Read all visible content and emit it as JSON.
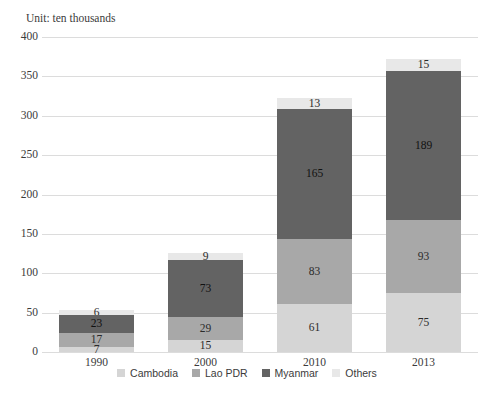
{
  "chart_data": {
    "type": "bar",
    "subtype": "stacked-bar",
    "title": "",
    "unit_note": "Unit: ten thousands",
    "xlabel": "",
    "ylabel": "",
    "categories": [
      "1990",
      "2000",
      "2010",
      "2013"
    ],
    "ylim": [
      0,
      400
    ],
    "yticks": [
      0,
      50,
      100,
      150,
      200,
      250,
      300,
      350,
      400
    ],
    "ytick_labels": [
      "0",
      "50",
      "100",
      "150",
      "200",
      "250",
      "300",
      "350",
      "400"
    ],
    "grid": true,
    "legend_position": "bottom",
    "stack_order_bottom_to_top": [
      "Cambodia",
      "Lao PDR",
      "Myanmar",
      "Others"
    ],
    "series": [
      {
        "name": "Cambodia",
        "color": "#d5d5d5",
        "values": [
          7,
          15,
          61,
          75
        ],
        "labels": [
          "7",
          "15",
          "61",
          "75"
        ]
      },
      {
        "name": "Lao PDR",
        "color": "#a8a8a8",
        "values": [
          17,
          29,
          83,
          93
        ],
        "labels": [
          "17",
          "29",
          "83",
          "93"
        ]
      },
      {
        "name": "Myanmar",
        "color": "#636363",
        "values": [
          23,
          73,
          165,
          189
        ],
        "labels": [
          "23",
          "73",
          "165",
          "189"
        ]
      },
      {
        "name": "Others",
        "color": "#e8e8e8",
        "values": [
          6,
          9,
          13,
          15
        ],
        "labels": [
          "6",
          "9",
          "13",
          "15"
        ]
      }
    ],
    "totals": [
      53,
      126,
      322,
      372
    ]
  },
  "legend": {
    "items": [
      {
        "label": "Cambodia",
        "color": "#d5d5d5"
      },
      {
        "label": "Lao PDR",
        "color": "#a8a8a8"
      },
      {
        "label": "Myanmar",
        "color": "#636363"
      },
      {
        "label": "Others",
        "color": "#e8e8e8"
      }
    ]
  },
  "colors": {
    "gridline": "#dcdcdc",
    "text": "#3b3b3b",
    "background": "#ffffff"
  }
}
